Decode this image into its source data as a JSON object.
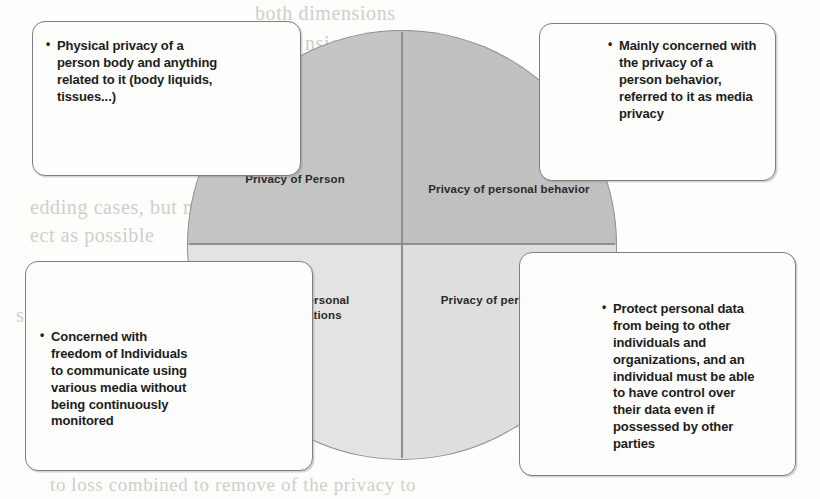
{
  "diagram": {
    "type": "quadrant-circle-diagram",
    "quadrants": [
      {
        "id": "privacy-of-person",
        "label": "Privacy of Person",
        "position": "top-left",
        "fill": "#c5c5c5"
      },
      {
        "id": "privacy-of-personal-behavior",
        "label": "Privacy of personal behavior",
        "position": "top-right",
        "fill": "#c0c0c0"
      },
      {
        "id": "privacy-of-personal-communications",
        "label": "Privacy of personal communications",
        "position": "bottom-left",
        "fill": "#e3e3e3"
      },
      {
        "id": "privacy-of-personal-data",
        "label": "Privacy of personal data",
        "position": "bottom-right",
        "fill": "#dedede"
      }
    ],
    "callouts": [
      {
        "id": "callout-person",
        "position": "top-left",
        "bullet": "•",
        "text": "Physical privacy of a person body and anything related to it (body liquids, tissues...)"
      },
      {
        "id": "callout-behavior",
        "position": "top-right",
        "bullet": "•",
        "text": "Mainly concerned with the privacy of a person behavior, referred to it as media privacy"
      },
      {
        "id": "callout-communications",
        "position": "bottom-left",
        "bullet": "•",
        "text": "Concerned with freedom of Individuals to communicate using various media without being continuously monitored"
      },
      {
        "id": "callout-data",
        "position": "bottom-right",
        "bullet": "•",
        "text": "Protect personal data from being to other individuals and organizations, and an individual must be able to have control over their data even if possessed by other parties"
      }
    ]
  },
  "scan_bleedthrough": {
    "note": "faint mirrored text showing through from the reverse side of the scanned page",
    "lines": [
      "both dimensions",
      "nsional and the",
      "ation (Privacy of person cor",
      "nd several or identifies kept to",
      "ect individual Level fo",
      "edding cases, but ma is also fundamental",
      "ect as possible",
      "ndom; any pseudonym identifiers to act as users: ident",
      "sensitive Propagation",
      "to be used or processing kept through",
      "ly widening the information privacy the",
      "urce at Level for no sensitive fi",
      "noticed privacy, individual be based on the general",
      "privacy",
      "to loss combined to remove of the privacy to"
    ]
  }
}
